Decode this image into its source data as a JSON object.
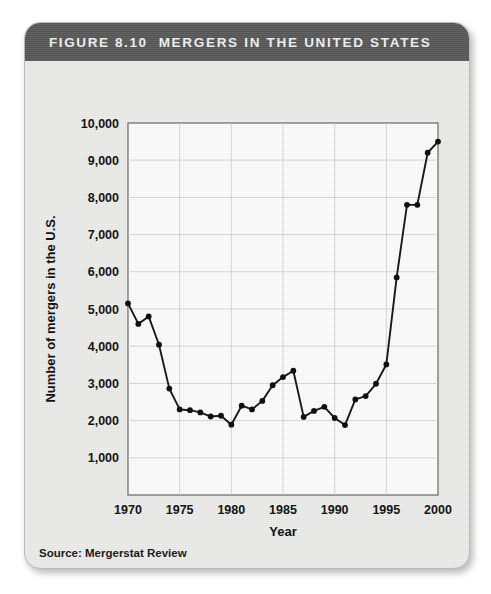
{
  "figure": {
    "number_label": "FIGURE 8.10",
    "title": "MERGERS IN THE UNITED STATES",
    "source_note": "Source: Mergerstat Review",
    "header_bg": "#5c5c5c",
    "header_text_color": "#f2f2f0",
    "panel_bg": "#eeeeec",
    "plot_bg": "#ffffff",
    "line_color": "#1a1a1a",
    "grid_color": "#cfcfcf"
  },
  "chart_data": {
    "type": "line",
    "title": "MERGERS IN THE UNITED STATES",
    "xlabel": "Year",
    "ylabel": "Number of mergers in the U.S.",
    "xlim": [
      1970,
      2000
    ],
    "ylim": [
      0,
      10000
    ],
    "grid": true,
    "legend": false,
    "x_ticks": [
      1970,
      1975,
      1980,
      1985,
      1990,
      1995,
      2000
    ],
    "x_tick_labels": [
      "1970",
      "1975",
      "1980",
      "1985",
      "1990",
      "1995",
      "2000"
    ],
    "y_ticks": [
      1000,
      2000,
      3000,
      4000,
      5000,
      6000,
      7000,
      8000,
      9000,
      10000
    ],
    "y_tick_labels": [
      "1,000",
      "2,000",
      "3,000",
      "4,000",
      "5,000",
      "6,000",
      "7,000",
      "8,000",
      "9,000",
      "10,000"
    ],
    "x": [
      1970,
      1971,
      1972,
      1973,
      1974,
      1975,
      1976,
      1977,
      1978,
      1979,
      1980,
      1981,
      1982,
      1983,
      1984,
      1985,
      1986,
      1987,
      1988,
      1989,
      1990,
      1991,
      1992,
      1993,
      1994,
      1995,
      1996,
      1997,
      1998,
      1999,
      2000
    ],
    "values": [
      5150,
      4600,
      4800,
      4040,
      2860,
      2300,
      2280,
      2220,
      2110,
      2130,
      1890,
      2400,
      2300,
      2530,
      2950,
      3170,
      3340,
      2100,
      2260,
      2370,
      2070,
      1880,
      2570,
      2660,
      2990,
      3510,
      5850,
      7800,
      7800,
      9200,
      9500
    ],
    "annotations": [
      "Peak in 1986 at about 3,300 mergers",
      "Sharp decline to 1,880 mergers in 1992",
      "Rapid growth after 1995 reaching about 9,500 in 2000"
    ]
  }
}
